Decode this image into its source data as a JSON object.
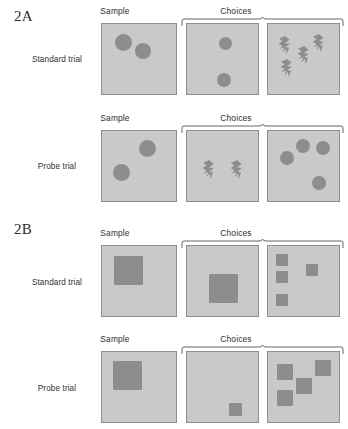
{
  "figure": {
    "sections": [
      {
        "tag": "2A",
        "tag_x": 14,
        "tag_y": 8,
        "stimulus_kind": "circle",
        "rows": [
          {
            "label": "Standard trial",
            "label_x": 20,
            "label_y": 55,
            "headers": [
              {
                "text": "Sample",
                "x": 115,
                "y": 6
              },
              {
                "text": "Choices",
                "x": 236,
                "y": 6
              }
            ],
            "bracket": {
              "x": 181,
              "y": 17
            },
            "panels": [
              {
                "role": "sample",
                "x": 101,
                "y": 23,
                "w": 76,
                "h": 72,
                "items": [
                  {
                    "shape": "circle",
                    "x": 13,
                    "y": 10,
                    "size": 17
                  },
                  {
                    "shape": "circle",
                    "x": 33,
                    "y": 19,
                    "size": 16
                  }
                ]
              },
              {
                "role": "choice-matching",
                "x": 186,
                "y": 23,
                "w": 73,
                "h": 72,
                "items": [
                  {
                    "shape": "circle",
                    "x": 32,
                    "y": 13,
                    "size": 13
                  },
                  {
                    "shape": "circle",
                    "x": 30,
                    "y": 49,
                    "size": 14
                  }
                ]
              },
              {
                "role": "choice-alternative",
                "x": 267,
                "y": 23,
                "w": 73,
                "h": 72,
                "items": [
                  {
                    "shape": "bolt",
                    "x": 10,
                    "y": 12,
                    "w": 13,
                    "h": 22
                  },
                  {
                    "shape": "bolt",
                    "x": 44,
                    "y": 10,
                    "w": 13,
                    "h": 22
                  },
                  {
                    "shape": "bolt",
                    "x": 29,
                    "y": 22,
                    "w": 13,
                    "h": 22
                  },
                  {
                    "shape": "bolt",
                    "x": 12,
                    "y": 35,
                    "w": 13,
                    "h": 22
                  }
                ]
              }
            ]
          },
          {
            "label": "Probe trial",
            "label_x": 20,
            "label_y": 162,
            "headers": [
              {
                "text": "Sample",
                "x": 115,
                "y": 113
              },
              {
                "text": "Choices",
                "x": 236,
                "y": 113
              }
            ],
            "bracket": {
              "x": 181,
              "y": 124
            },
            "panels": [
              {
                "role": "sample",
                "x": 101,
                "y": 130,
                "w": 76,
                "h": 72,
                "items": [
                  {
                    "shape": "circle",
                    "x": 37,
                    "y": 9,
                    "size": 17
                  },
                  {
                    "shape": "circle",
                    "x": 11,
                    "y": 33,
                    "size": 17
                  }
                ]
              },
              {
                "role": "choice-alternative",
                "x": 186,
                "y": 130,
                "w": 73,
                "h": 72,
                "items": [
                  {
                    "shape": "bolt",
                    "x": 15,
                    "y": 29,
                    "w": 13,
                    "h": 23
                  },
                  {
                    "shape": "bolt",
                    "x": 43,
                    "y": 29,
                    "w": 13,
                    "h": 23
                  }
                ]
              },
              {
                "role": "choice-matching",
                "x": 267,
                "y": 130,
                "w": 73,
                "h": 72,
                "items": [
                  {
                    "shape": "circle",
                    "x": 28,
                    "y": 8,
                    "size": 14
                  },
                  {
                    "shape": "circle",
                    "x": 48,
                    "y": 10,
                    "size": 14
                  },
                  {
                    "shape": "circle",
                    "x": 12,
                    "y": 20,
                    "size": 14
                  },
                  {
                    "shape": "circle",
                    "x": 44,
                    "y": 45,
                    "size": 14
                  }
                ]
              }
            ]
          }
        ]
      },
      {
        "tag": "2B",
        "tag_x": 14,
        "tag_y": 221,
        "stimulus_kind": "square",
        "rows": [
          {
            "label": "Standard trial",
            "label_x": 20,
            "label_y": 278,
            "headers": [
              {
                "text": "Sample",
                "x": 115,
                "y": 228
              },
              {
                "text": "Choices",
                "x": 236,
                "y": 228
              }
            ],
            "bracket": {
              "x": 181,
              "y": 239
            },
            "panels": [
              {
                "role": "sample",
                "x": 101,
                "y": 245,
                "w": 76,
                "h": 72,
                "items": [
                  {
                    "shape": "square",
                    "x": 12,
                    "y": 10,
                    "size": 29
                  }
                ]
              },
              {
                "role": "choice-matching",
                "x": 186,
                "y": 245,
                "w": 73,
                "h": 72,
                "items": [
                  {
                    "shape": "square",
                    "x": 22,
                    "y": 28,
                    "size": 29
                  }
                ]
              },
              {
                "role": "choice-alternative",
                "x": 267,
                "y": 245,
                "w": 73,
                "h": 72,
                "items": [
                  {
                    "shape": "square",
                    "x": 8,
                    "y": 8,
                    "size": 12
                  },
                  {
                    "shape": "square",
                    "x": 8,
                    "y": 25,
                    "size": 12
                  },
                  {
                    "shape": "square",
                    "x": 38,
                    "y": 18,
                    "size": 12
                  },
                  {
                    "shape": "square",
                    "x": 8,
                    "y": 48,
                    "size": 12
                  }
                ]
              }
            ]
          },
          {
            "label": "Probe trial",
            "label_x": 20,
            "label_y": 384,
            "headers": [
              {
                "text": "Sample",
                "x": 115,
                "y": 334
              },
              {
                "text": "Choices",
                "x": 236,
                "y": 334
              }
            ],
            "bracket": {
              "x": 181,
              "y": 345
            },
            "panels": [
              {
                "role": "sample",
                "x": 101,
                "y": 351,
                "w": 76,
                "h": 72,
                "items": [
                  {
                    "shape": "square",
                    "x": 11,
                    "y": 9,
                    "size": 29
                  }
                ]
              },
              {
                "role": "choice-alternative",
                "x": 186,
                "y": 351,
                "w": 73,
                "h": 72,
                "items": [
                  {
                    "shape": "square",
                    "x": 42,
                    "y": 51,
                    "size": 13
                  }
                ]
              },
              {
                "role": "choice-matching",
                "x": 267,
                "y": 351,
                "w": 73,
                "h": 72,
                "items": [
                  {
                    "shape": "square",
                    "x": 9,
                    "y": 12,
                    "size": 16
                  },
                  {
                    "shape": "square",
                    "x": 47,
                    "y": 8,
                    "size": 16
                  },
                  {
                    "shape": "square",
                    "x": 28,
                    "y": 26,
                    "size": 16
                  },
                  {
                    "shape": "square",
                    "x": 9,
                    "y": 38,
                    "size": 16
                  }
                ]
              }
            ]
          }
        ]
      }
    ],
    "colors": {
      "page_background": "#ffffff",
      "panel_background": "#c9c9c9",
      "panel_border": "#8e8e8e",
      "stimulus_fill": "#8d8d8d",
      "text": "#2d2d2d",
      "bracket_line": "#555555"
    }
  }
}
